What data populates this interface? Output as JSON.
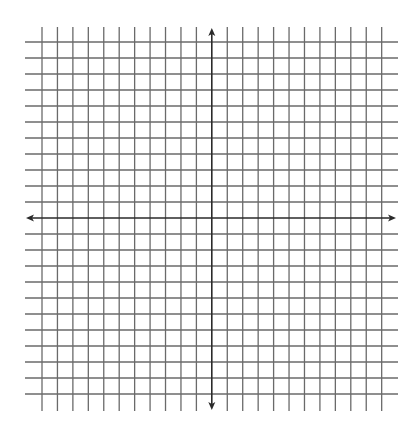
{
  "diagram": {
    "type": "coordinate-grid",
    "background": "#ffffff",
    "grid_color": "#6a6a6a",
    "axis_color": "#2a2a2a",
    "vertical_lines": {
      "count": 23,
      "x_start": 42,
      "spacing": 15.44,
      "y_top": 27,
      "y_bottom": 411,
      "axis_index": 11
    },
    "horizontal_lines": {
      "count": 23,
      "y_start": 42,
      "spacing": 16,
      "x_left": 25,
      "x_right": 398,
      "axis_index": 11
    },
    "x_axis": {
      "y": 218,
      "x_left": 26,
      "x_right": 396,
      "arrows": [
        "left",
        "right"
      ]
    },
    "y_axis": {
      "x": 211.8,
      "y_top": 28,
      "y_bottom": 410,
      "arrows": [
        "up",
        "down"
      ]
    }
  }
}
